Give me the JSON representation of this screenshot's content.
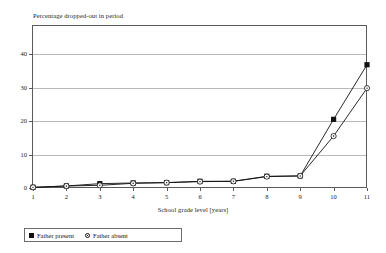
{
  "chart_data": {
    "type": "line",
    "title": "",
    "ylabel": "Percentage dropped-out in period",
    "xlabel": "School grade level [years]",
    "x": [
      1,
      2,
      3,
      4,
      5,
      6,
      7,
      8,
      9,
      10,
      11
    ],
    "xticklabels": [
      "1",
      "2",
      "3",
      "4",
      "5",
      "6",
      "7",
      "8",
      "9",
      "10",
      "11"
    ],
    "yticklabels": [
      "0",
      "10",
      "20",
      "30",
      "40"
    ],
    "yticks": [
      0,
      10,
      20,
      30,
      40
    ],
    "xlim": [
      1,
      11
    ],
    "ylim": [
      0,
      45
    ],
    "grid": true,
    "grid_axis": "y",
    "legend_position": "below-left",
    "series": [
      {
        "name": "Father present",
        "marker": "filled-square",
        "color": "#111111",
        "values": [
          0.2,
          0.6,
          1.3,
          1.5,
          1.6,
          2.0,
          2.0,
          3.5,
          3.6,
          20.5,
          36.8
        ]
      },
      {
        "name": "Father absent",
        "marker": "open-circle",
        "color": "#111111",
        "values": [
          0.2,
          0.6,
          0.8,
          1.4,
          1.6,
          1.9,
          2.0,
          3.4,
          3.6,
          15.5,
          29.8
        ]
      }
    ]
  },
  "legend": {
    "entries": [
      {
        "label": "Father present",
        "marker": "filled-square"
      },
      {
        "label": "Father absent",
        "marker": "open-circle"
      }
    ]
  }
}
